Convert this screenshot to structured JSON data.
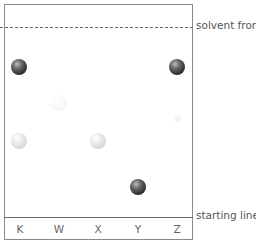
{
  "diagram": {
    "type": "paper chromatography",
    "labels": {
      "solvent_front": "solvent front",
      "starting_line": "starting line"
    },
    "lanes": [
      "K",
      "W",
      "X",
      "Y",
      "Z"
    ],
    "spots": [
      {
        "lane": "K",
        "shade": "dark",
        "height_rel": 0.79
      },
      {
        "lane": "K",
        "shade": "light",
        "height_rel": 0.41
      },
      {
        "lane": "W",
        "shade": "very light",
        "height_rel": 0.61
      },
      {
        "lane": "X",
        "shade": "light",
        "height_rel": 0.41
      },
      {
        "lane": "Y",
        "shade": "dark",
        "height_rel": 0.16
      },
      {
        "lane": "Z",
        "shade": "dark",
        "height_rel": 0.79
      },
      {
        "lane": "Z",
        "shade": "very faint",
        "height_rel": 0.52
      }
    ]
  }
}
